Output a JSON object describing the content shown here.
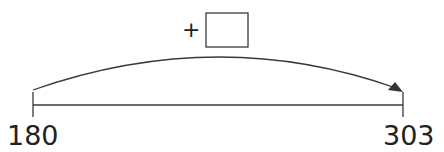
{
  "diagram": {
    "type": "number-line-jump",
    "operator": "+",
    "answer_box": "",
    "start": {
      "value": "180"
    },
    "end": {
      "value": "303"
    },
    "colors": {
      "line": "#3a3a3a",
      "text": "#222222",
      "arrow": "#333333"
    }
  }
}
